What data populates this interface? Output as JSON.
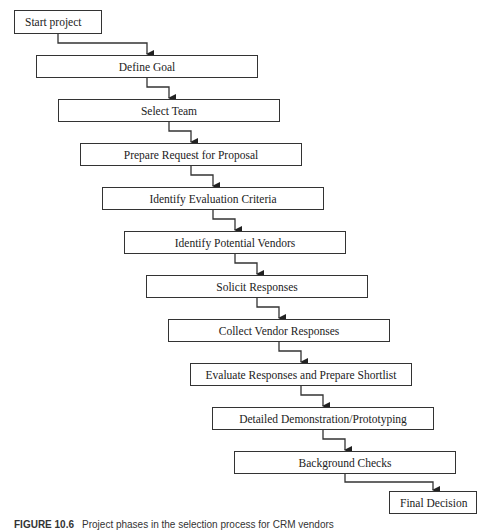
{
  "diagram": {
    "type": "staircase-flowchart",
    "steps": [
      {
        "label": "Start project"
      },
      {
        "label": "Define Goal"
      },
      {
        "label": "Select Team"
      },
      {
        "label": "Prepare Request for Proposal"
      },
      {
        "label": "Identify Evaluation Criteria"
      },
      {
        "label": "Identify Potential Vendors"
      },
      {
        "label": "Solicit Responses"
      },
      {
        "label": "Collect Vendor Responses"
      },
      {
        "label": "Evaluate Responses and Prepare Shortlist"
      },
      {
        "label": "Detailed Demonstration/Prototyping"
      },
      {
        "label": "Background Checks"
      },
      {
        "label": "Final Decision"
      }
    ]
  },
  "caption": {
    "figure_label": "FIGURE 10.6",
    "text": "Project phases in the selection process for CRM vendors"
  },
  "colors": {
    "stroke": "#333333",
    "background": "#ffffff"
  }
}
